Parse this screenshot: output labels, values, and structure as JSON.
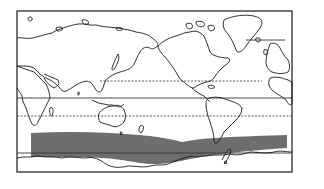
{
  "map": {
    "projection": "world-map-pacific-centered",
    "frame": {
      "x": 17,
      "y": 11,
      "width": 275,
      "height": 161
    },
    "latitude_lines": [
      {
        "name": "arctic-circle",
        "style": "solid",
        "y": 40
      },
      {
        "name": "tropic-of-cancer",
        "style": "dashed",
        "y": 81
      },
      {
        "name": "equator",
        "style": "solid",
        "y": 98
      },
      {
        "name": "tropic-of-capricorn",
        "style": "dashed",
        "y": 116
      },
      {
        "name": "antarctic-circle",
        "style": "solid",
        "y": 153
      }
    ],
    "highlight_band": {
      "name": "southern-ocean-westerly-belt",
      "color": "#6e6e6e"
    },
    "colors": {
      "land_stroke": "#1a1a1a",
      "band": "#6e6e6e",
      "background": "#ffffff"
    }
  }
}
